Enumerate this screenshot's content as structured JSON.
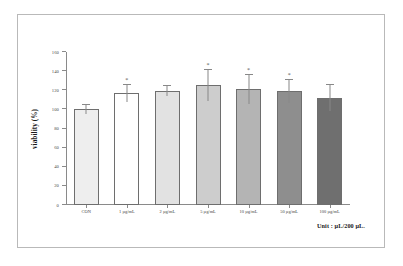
{
  "figure": {
    "unit_note": "Unit : µL/200 µL."
  },
  "chart_data": {
    "type": "bar",
    "title": "",
    "xlabel": "",
    "ylabel": "viability (%)",
    "ylim": [
      0,
      160
    ],
    "ytick_step": 20,
    "yticks": [
      "0",
      "20",
      "40",
      "60",
      "80",
      "100",
      "120",
      "140",
      "160"
    ],
    "grid": false,
    "legend": "none",
    "categories": [
      "CON",
      "1 µg/mL",
      "2 µg/mL",
      "5 µg/mL",
      "10 µg/mL",
      "50 µg/mL",
      "100 µg/mL"
    ],
    "values": [
      100,
      117,
      119,
      125,
      121,
      119,
      112
    ],
    "errors": [
      5,
      9,
      5,
      16,
      15,
      12,
      14
    ],
    "significance": [
      "",
      "*",
      "",
      "*",
      "*",
      "*",
      ""
    ],
    "bar_colors": [
      "#eeeeee",
      "#ffffff",
      "#e2e2e2",
      "#cdcdcd",
      "#b4b4b4",
      "#8e8e8e",
      "#6f6f6f"
    ],
    "bar_edge_color": "#6e6e6e",
    "error_color": "#888888",
    "axis_color": "#8a8a8a"
  }
}
